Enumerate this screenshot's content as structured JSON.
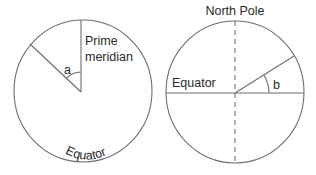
{
  "diagram": {
    "left_globe": {
      "labels": {
        "prime_meridian_line1": "Prime",
        "prime_meridian_line2": "meridian",
        "angle": "a",
        "equator": "Equator"
      },
      "view": "view from above the pole; equator is the circle outline"
    },
    "right_globe": {
      "labels": {
        "north_pole": "North Pole",
        "equator": "Equator",
        "angle": "b"
      },
      "view": "side view; dashed line is the polar axis, horizontal line is the equator"
    },
    "colors": {
      "line": "#6e6e6e",
      "text": "#2a2a2a",
      "background": "#ffffff"
    }
  }
}
